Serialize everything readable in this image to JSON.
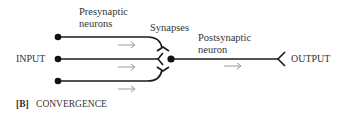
{
  "labels": {
    "presynaptic_line1": "Presynaptic",
    "presynaptic_line2": "neurons",
    "synapses": "Synapses",
    "postsynaptic_line1": "Postsynaptic",
    "postsynaptic_line2": "neuron",
    "input": "INPUT",
    "output": "OUTPUT",
    "caption_tag": "[B]",
    "caption_text": "CONVERGENCE"
  },
  "colors": {
    "line": "#1a1a1a",
    "arrow": "#9a9a9a",
    "text": "#333333"
  }
}
